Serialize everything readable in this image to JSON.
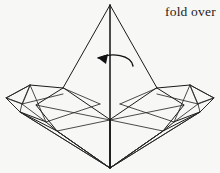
{
  "figure": {
    "background_color": "#f7f7f5",
    "line_color": "#1a1a1a",
    "canvas": {
      "width": 220,
      "height": 173
    }
  },
  "caption": {
    "text": "fold over",
    "x": 165,
    "y": 16,
    "font_size": 13.5,
    "clipped_at_right_edge": true
  },
  "arrow": {
    "name": "fold-over-arrow",
    "direction": "right-to-left-curving",
    "curve_path": "M 133 66 C 131 55 112 52 98 58",
    "head_points": "98,58 108,54 106,64",
    "color": "#111111"
  },
  "shapes": {
    "center_peak": {
      "apex": [
        110,
        5
      ],
      "left_base": [
        63,
        88
      ],
      "right_base": [
        157,
        88
      ],
      "path": "M 110 5 L 63 88 M 110 5 L 157 88"
    },
    "spine": {
      "name": "vertical-center-fold",
      "path": "M 110 5 L 110 168"
    },
    "body_left": {
      "path": "M 63 88 L 36 105 L 57 131 L 110 168 L 110 120 Z"
    },
    "body_right": {
      "path": "M 157 88 L 184 105 L 163 131 L 110 168 L 110 120 Z"
    },
    "left_wing_outer": {
      "path": "M 63 88 L 30 85 L 6 98 L 20 112 L 57 131"
    },
    "right_wing_outer": {
      "path": "M 157 88 L 190 85 L 214 98 L 200 112 L 163 131"
    },
    "left_tip_facets": [
      {
        "name": "left-tip-upper-facet",
        "path": "M 30 85 L 6 98 L 22 104 Z"
      },
      {
        "name": "left-tip-lower-facet",
        "path": "M 6 98 L 20 112 L 22 104 Z"
      },
      {
        "name": "left-tip-crease-a",
        "path": "M 30 85 L 22 104"
      },
      {
        "name": "left-tip-crease-b",
        "path": "M 22 104 L 63 94"
      },
      {
        "name": "left-tip-crease-c",
        "path": "M 22 104 L 46 122"
      }
    ],
    "right_tip_facets": [
      {
        "name": "right-tip-upper-facet",
        "path": "M 190 85 L 214 98 L 198 104 Z"
      },
      {
        "name": "right-tip-lower-facet",
        "path": "M 214 98 L 200 112 L 198 104 Z"
      },
      {
        "name": "right-tip-crease-a",
        "path": "M 190 85 L 198 104"
      },
      {
        "name": "right-tip-crease-b",
        "path": "M 198 104 L 157 94"
      },
      {
        "name": "right-tip-crease-c",
        "path": "M 198 104 L 174 122"
      }
    ],
    "left_inner_creases": [
      {
        "name": "left-inner-crease-1",
        "path": "M 30 85 L 46 122"
      },
      {
        "name": "left-inner-crease-2",
        "path": "M 46 122 L 100 104"
      },
      {
        "name": "left-inner-crease-3",
        "path": "M 63 88 L 100 104"
      },
      {
        "name": "left-inner-crease-4",
        "path": "M 36 105 L 110 120"
      },
      {
        "name": "left-inner-crease-5",
        "path": "M 20 112 L 110 168"
      }
    ],
    "right_inner_creases": [
      {
        "name": "right-inner-crease-1",
        "path": "M 190 85 L 174 122"
      },
      {
        "name": "right-inner-crease-2",
        "path": "M 174 122 L 120 104"
      },
      {
        "name": "right-inner-crease-3",
        "path": "M 157 88 L 120 104"
      },
      {
        "name": "right-inner-crease-4",
        "path": "M 184 105 L 110 120"
      },
      {
        "name": "right-inner-crease-5",
        "path": "M 200 112 L 110 168"
      }
    ],
    "bottom_left_panel": {
      "path": "M 46 122 L 57 131 L 110 168 L 20 112 Z"
    },
    "bottom_right_panel": {
      "path": "M 174 122 L 163 131 L 110 168 L 200 112 Z"
    },
    "lower_center_left": {
      "path": "M 110 120 L 57 131 L 110 168"
    },
    "lower_center_right": {
      "path": "M 110 120 L 163 131 L 110 168"
    }
  }
}
